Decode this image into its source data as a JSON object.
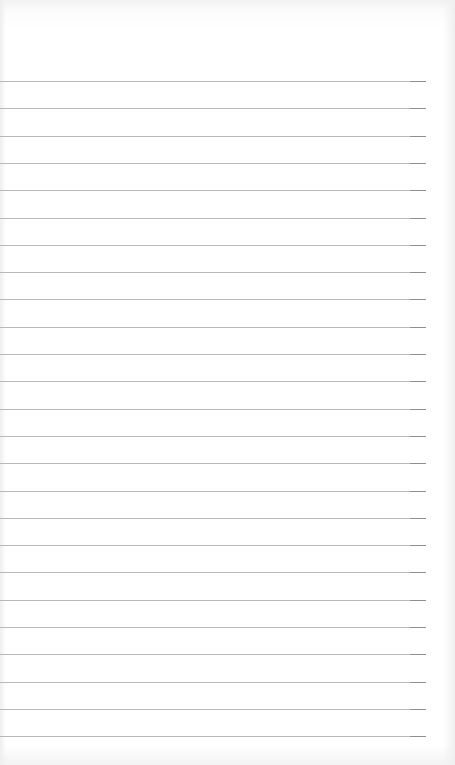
{
  "page": {
    "type": "lined-paper",
    "line_count": 25,
    "first_line_y": 81,
    "line_spacing": 27.3,
    "line_width": 426,
    "line_color": "#b9b9b9",
    "background_color": "#ffffff"
  }
}
